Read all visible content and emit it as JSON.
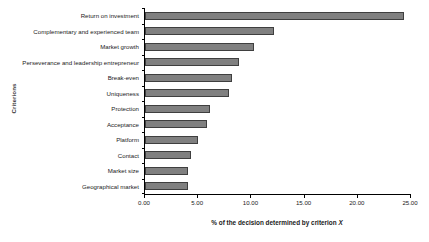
{
  "chart_data": {
    "type": "bar",
    "orientation": "horizontal",
    "title": "",
    "xlabel": "% of the decision determined by criterion X",
    "ylabel": "Criterions",
    "xlim": [
      0.0,
      25.0
    ],
    "grid": false,
    "legend": null,
    "bar_color": "#808080",
    "bar_edge_color": "#3f3f3f",
    "xticks": [
      "0.00",
      "5.00",
      "10.00",
      "15.00",
      "20.00",
      "25.00"
    ],
    "xtick_values": [
      0.0,
      5.0,
      10.0,
      15.0,
      20.0,
      25.0
    ],
    "categories": [
      "Return on investment",
      "Complementary and experienced team",
      "Market growth",
      "Perseverance and leadership entrepreneur",
      "Break-even",
      "Uniqueness",
      "Protection",
      "Acceptance",
      "Platform",
      "Contact",
      "Market size",
      "Geographical market"
    ],
    "values": [
      24.3,
      12.1,
      10.2,
      8.8,
      8.2,
      7.9,
      6.1,
      5.8,
      5.0,
      4.3,
      4.0,
      4.0
    ]
  }
}
